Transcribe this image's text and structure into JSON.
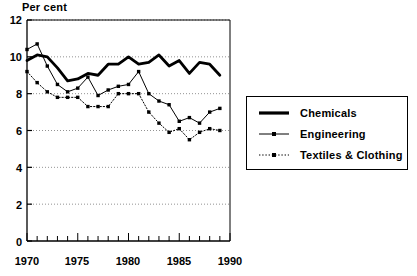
{
  "chart_data": {
    "type": "line",
    "title": "",
    "ylabel": "Per cent",
    "xlabel": "",
    "ylim": [
      0,
      12
    ],
    "xlim": [
      1970,
      1990
    ],
    "yticks": [
      0,
      2,
      4,
      6,
      8,
      10,
      12
    ],
    "ytick_labels": [
      "0",
      "2",
      "4",
      "6",
      "8",
      "10",
      "12"
    ],
    "xticks": [
      1970,
      1975,
      1980,
      1985,
      1990
    ],
    "xtick_labels": [
      "1970",
      "1975",
      "1980",
      "1985",
      "1990"
    ],
    "x_minor_step": 1,
    "grid": true,
    "grid_axis": "y",
    "legend_position": "right-outside",
    "x": [
      1970,
      1971,
      1972,
      1973,
      1974,
      1975,
      1976,
      1977,
      1978,
      1979,
      1980,
      1981,
      1982,
      1983,
      1984,
      1985,
      1986,
      1987,
      1988,
      1989
    ],
    "series": [
      {
        "name": "Chemicals",
        "style": "solid-thick",
        "marker": "none",
        "color": "#000000",
        "values": [
          9.8,
          10.1,
          10.0,
          9.4,
          8.7,
          8.8,
          9.1,
          9.0,
          9.6,
          9.6,
          10.0,
          9.6,
          9.7,
          10.1,
          9.5,
          9.8,
          9.1,
          9.7,
          9.6,
          9.0
        ]
      },
      {
        "name": "Engineering",
        "style": "solid-thin",
        "marker": "square",
        "color": "#000000",
        "values": [
          10.4,
          10.7,
          9.5,
          8.5,
          8.1,
          8.3,
          8.9,
          7.9,
          8.2,
          8.4,
          8.5,
          9.2,
          8.0,
          7.6,
          7.4,
          6.5,
          6.7,
          6.4,
          7.0,
          7.2
        ]
      },
      {
        "name": "Textiles & Clothing",
        "style": "dotted",
        "marker": "square",
        "color": "#000000",
        "values": [
          9.2,
          8.6,
          8.1,
          7.8,
          7.8,
          7.8,
          7.3,
          7.3,
          7.3,
          8.0,
          8.0,
          8.0,
          7.0,
          6.4,
          5.9,
          6.1,
          5.5,
          5.9,
          6.1,
          6.0
        ]
      }
    ]
  },
  "legend": {
    "items": [
      {
        "label": "Chemicals"
      },
      {
        "label": "Engineering"
      },
      {
        "label": "Textiles & Clothing"
      }
    ]
  }
}
